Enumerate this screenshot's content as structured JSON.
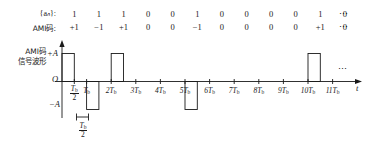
{
  "figure": {
    "sequence_row": {
      "label": "{aₙ}:",
      "label_plain": "{a_n}:",
      "values": [
        "1",
        "1",
        "1",
        "0",
        "0",
        "1",
        "0",
        "0",
        "0",
        "0",
        "1",
        "0"
      ],
      "trailing": "⋯"
    },
    "ami_row": {
      "label": "AMI码:",
      "values": [
        "+1",
        "−1",
        "+1",
        "0",
        "0",
        "−1",
        "0",
        "0",
        "0",
        "0",
        "+1",
        "0"
      ],
      "trailing": "⋯"
    },
    "waveform": {
      "caption_line1": "AMI码",
      "caption_line2": "信号波形",
      "y_labels": {
        "positive": "+A",
        "origin": "O",
        "negative": "−A"
      },
      "x_axis_label": "t",
      "axis_trailing": "⋯",
      "tick_labels": [
        {
          "text": "Tb/2",
          "kind": "fraction",
          "num": "T",
          "num_sub": "b",
          "den": "2"
        },
        {
          "text": "Tb",
          "kind": "plain",
          "num": "T",
          "num_sub": "b",
          "coef": ""
        },
        {
          "text": "2Tb",
          "kind": "plain",
          "num": "T",
          "num_sub": "b",
          "coef": "2"
        },
        {
          "text": "3Tb",
          "kind": "plain",
          "num": "T",
          "num_sub": "b",
          "coef": "3"
        },
        {
          "text": "4Tb",
          "kind": "plain",
          "num": "T",
          "num_sub": "b",
          "coef": "4"
        },
        {
          "text": "5Tb",
          "kind": "plain",
          "num": "T",
          "num_sub": "b",
          "coef": "5"
        },
        {
          "text": "6Tb",
          "kind": "plain",
          "num": "T",
          "num_sub": "b",
          "coef": "6"
        },
        {
          "text": "7Tb",
          "kind": "plain",
          "num": "T",
          "num_sub": "b",
          "coef": "7"
        },
        {
          "text": "8Tb",
          "kind": "plain",
          "num": "T",
          "num_sub": "b",
          "coef": "8"
        },
        {
          "text": "9Tb",
          "kind": "plain",
          "num": "T",
          "num_sub": "b",
          "coef": "9"
        },
        {
          "text": "10Tb",
          "kind": "plain",
          "num": "T",
          "num_sub": "b",
          "coef": "10"
        },
        {
          "text": "11Tb",
          "kind": "plain",
          "num": "T",
          "num_sub": "b",
          "coef": "11"
        }
      ],
      "pulse_width_annotation": {
        "num": "T",
        "num_sub": "b",
        "den": "2",
        "text": "Tb/2"
      },
      "line_color": "#1a1a1a"
    }
  },
  "chart_data": {
    "type": "line",
    "xlabel": "t",
    "ylabel": "",
    "ylim": [
      -1,
      1
    ],
    "xlim": [
      0,
      12
    ],
    "grid": false,
    "legend": false,
    "x_tick_labels": [
      "Tb/2",
      "Tb",
      "2Tb",
      "3Tb",
      "4Tb",
      "5Tb",
      "6Tb",
      "7Tb",
      "8Tb",
      "9Tb",
      "10Tb",
      "11Tb"
    ],
    "y_tick_labels": [
      "+A",
      "O",
      "−A"
    ],
    "categories": [
      "0",
      "1",
      "2",
      "3",
      "4",
      "5",
      "6",
      "7",
      "8",
      "9",
      "10",
      "11"
    ],
    "series": [
      {
        "name": "{a_n} binary sequence",
        "values": [
          1,
          1,
          1,
          0,
          0,
          1,
          0,
          0,
          0,
          0,
          1,
          0
        ]
      },
      {
        "name": "AMI code",
        "values": [
          1,
          -1,
          1,
          0,
          0,
          -1,
          0,
          0,
          0,
          0,
          1,
          0
        ]
      },
      {
        "name": "AMI waveform amplitude (A units, RZ 50% duty)",
        "values": [
          1,
          -1,
          1,
          0,
          0,
          -1,
          0,
          0,
          0,
          0,
          1,
          0
        ]
      }
    ],
    "pulse_duty_cycle": "Tb/2",
    "annotations": [
      "Pulse width = Tb/2 (return-to-zero)",
      "Alternate mark inversion: successive 1s alternate +A / −A"
    ]
  }
}
